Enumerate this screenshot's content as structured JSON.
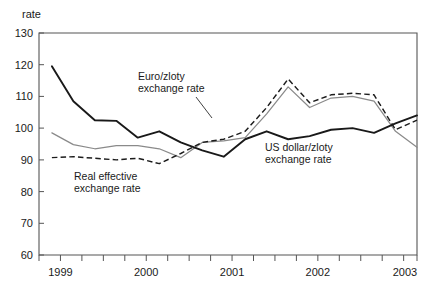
{
  "chart_data": {
    "type": "line",
    "title": "",
    "subtitle": "",
    "ylabel": "rate",
    "xlabel": "",
    "ylim": [
      60,
      130
    ],
    "y_ticks": [
      60,
      70,
      80,
      90,
      100,
      110,
      120,
      130
    ],
    "y_tick_labels": [
      "60",
      "70",
      "80",
      "90",
      "100",
      "110",
      "120",
      "130"
    ],
    "x_tick_labels": [
      "1999",
      "2000",
      "2001",
      "2002",
      "2003"
    ],
    "x_major_labeled_positions": [
      1999.0,
      2000.0,
      2001.0,
      2002.0,
      2003.0
    ],
    "x_minor_ticks_per_year": 4,
    "xlim": [
      1998.6,
      2003.0
    ],
    "grid": false,
    "legend_position": "inline-annotations",
    "x": [
      1998.75,
      1999.0,
      1999.25,
      1999.5,
      1999.75,
      2000.0,
      2000.25,
      2000.5,
      2000.75,
      2001.0,
      2001.25,
      2001.5,
      2001.75,
      2002.0,
      2002.25,
      2002.5,
      2002.75,
      2003.0
    ],
    "series": [
      {
        "name": "US dollar/zloty exchange rate",
        "style": "solid",
        "color": "#191919",
        "values": [
          119.5,
          108.5,
          102.5,
          102.3,
          97.0,
          99.0,
          95.5,
          93.0,
          91.0,
          96.5,
          99.0,
          96.5,
          97.5,
          99.5,
          100.0,
          98.5,
          101.5,
          104.0
        ]
      },
      {
        "name": "Euro/zloty exchange rate",
        "style": "thin-solid-grey",
        "color": "#8a8a8a",
        "values": [
          98.5,
          94.8,
          93.5,
          94.5,
          94.5,
          93.5,
          90.7,
          95.5,
          96.0,
          97.0,
          104.5,
          113.0,
          106.5,
          109.5,
          110.0,
          108.5,
          99.0,
          94.0
        ]
      },
      {
        "name": "Real effective exchange rate",
        "style": "dashed",
        "color": "#1c1c1c",
        "values": [
          90.7,
          91.0,
          90.5,
          90.0,
          90.5,
          88.8,
          92.0,
          95.5,
          96.5,
          99.0,
          106.5,
          115.5,
          108.0,
          110.5,
          111.0,
          110.5,
          99.5,
          102.5
        ]
      }
    ],
    "annotations": [
      {
        "name": "euro-zloty-annotation",
        "line1": "Euro/zloty",
        "line2": "exchange rate",
        "target_series": "Euro/zloty exchange rate"
      },
      {
        "name": "real-effective-annotation",
        "line1": "Real effective",
        "line2": "exchange rate",
        "target_series": "Real effective exchange rate"
      },
      {
        "name": "usd-zloty-annotation",
        "line1": "US dollar/zloty",
        "line2": "exchange rate",
        "target_series": "US dollar/zloty exchange rate"
      }
    ]
  },
  "axis": {
    "y_title": "rate",
    "y_labels": [
      "130",
      "120",
      "110",
      "100",
      "90",
      "80",
      "70",
      "60"
    ],
    "x_labels": [
      "1999",
      "2000",
      "2001",
      "2002",
      "2003"
    ]
  },
  "annotations": {
    "euro": {
      "line1": "Euro/zloty",
      "line2": "exchange rate"
    },
    "reer": {
      "line1": "Real effective",
      "line2": "exchange rate"
    },
    "usd": {
      "line1": "US dollar/zloty",
      "line2": "exchange rate"
    }
  }
}
